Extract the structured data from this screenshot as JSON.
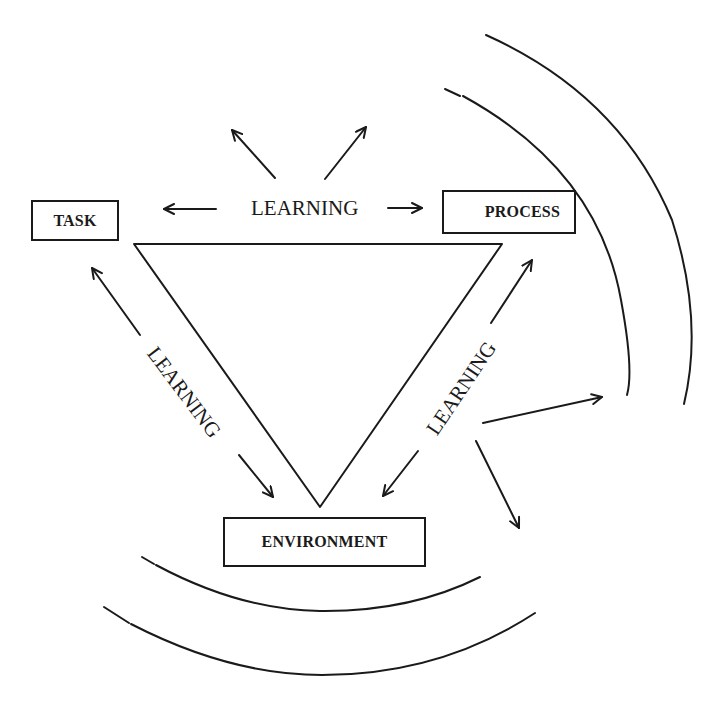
{
  "diagram": {
    "nodes": {
      "task": {
        "label": "TASK"
      },
      "process": {
        "label": "PROCESS"
      },
      "environment": {
        "label": "ENVIRONMENT"
      }
    },
    "edges": {
      "task_process": {
        "label": "LEARNING"
      },
      "task_environment": {
        "label": "LEARNING"
      },
      "process_environment": {
        "label": "LEARNING"
      }
    },
    "colors": {
      "ink": "#1a1a1a",
      "background": "#ffffff"
    }
  }
}
